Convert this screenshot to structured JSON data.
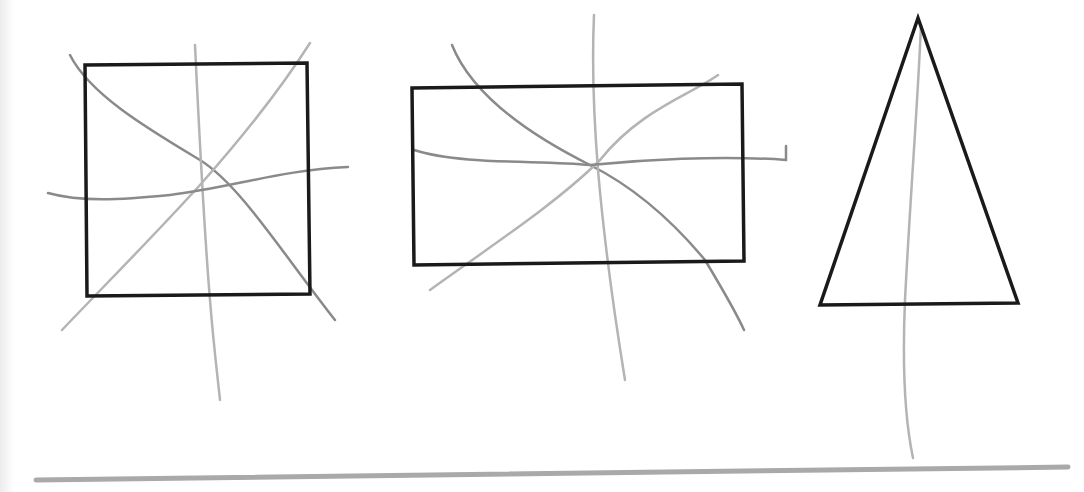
{
  "colors": {
    "background": "#ffffff",
    "shape_outline": "#1a1a1a",
    "symmetry_line_dark": "#8a8a8a",
    "symmetry_line_light": "#b4b4b4",
    "baseline": "#a9a9a9"
  },
  "shapes": [
    {
      "name": "square",
      "points": [
        [
          85,
          65
        ],
        [
          307,
          63
        ],
        [
          310,
          294
        ],
        [
          87,
          296
        ]
      ],
      "symmetry_lines": [
        {
          "d": "M70,55 C90,95 150,130 200,160 C240,185 280,250 335,320",
          "shade": "dark"
        },
        {
          "d": "M195,45 C200,150 205,240 210,300 C214,350 218,380 220,400",
          "shade": "light"
        },
        {
          "d": "M310,43 C280,90 240,140 200,185 C150,240 100,290 62,330",
          "shade": "light"
        },
        {
          "d": "M48,193 C80,202 120,200 170,195 C230,188 280,170 348,167",
          "shade": "dark"
        }
      ]
    },
    {
      "name": "rectangle",
      "points": [
        [
          412,
          88
        ],
        [
          742,
          84
        ],
        [
          744,
          261
        ],
        [
          414,
          265
        ]
      ],
      "symmetry_lines": [
        {
          "d": "M452,45 C470,90 520,130 590,165 C640,190 680,230 705,260 C720,285 735,310 744,330",
          "shade": "dark"
        },
        {
          "d": "M594,15 C592,60 594,120 598,170 C604,240 612,300 625,380",
          "shade": "light"
        },
        {
          "d": "M718,75 C690,95 640,110 600,160 C560,200 500,240 430,290",
          "shade": "light"
        },
        {
          "d": "M414,150 C460,165 540,160 590,165 C640,160 720,155 786,160 L786,146",
          "shade": "dark"
        }
      ]
    },
    {
      "name": "isosceles-triangle",
      "points": [
        [
          918,
          18
        ],
        [
          1018,
          303
        ],
        [
          820,
          305
        ]
      ],
      "symmetry_lines": [
        {
          "d": "M921,25 C918,100 910,200 905,300 C902,370 905,420 913,458",
          "shade": "light"
        }
      ]
    }
  ],
  "baseline": {
    "x1": 36,
    "y1": 480,
    "x2": 1068,
    "y2": 467
  }
}
